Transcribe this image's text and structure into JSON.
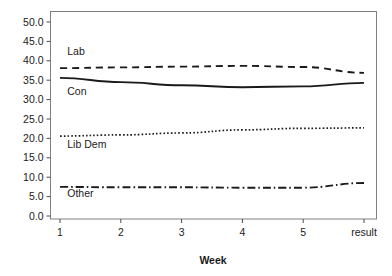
{
  "chart_data": {
    "type": "line",
    "title": "",
    "subtitle": "",
    "xlabel": "Week",
    "ylabel": "",
    "x": [
      1,
      2,
      3,
      4,
      5,
      6
    ],
    "categories": [
      "1",
      "2",
      "3",
      "4",
      "5",
      "result"
    ],
    "xlim": [
      1,
      6
    ],
    "ylim": [
      0,
      52
    ],
    "ytick_values": [
      0,
      5,
      10,
      15,
      20,
      25,
      30,
      35,
      40,
      45,
      50
    ],
    "ytick_labels": [
      "0.0",
      "5.0",
      "10.0",
      "15.0",
      "20.0",
      "25.0",
      "30.0",
      "35.0",
      "40.0",
      "45.0",
      "50.0"
    ],
    "xtick_labels": [
      "1",
      "2",
      "3",
      "4",
      "5",
      "result"
    ],
    "grid": false,
    "legend_position": "inline-annotations",
    "series": [
      {
        "name": "Lab",
        "linestyle": "dashed",
        "color": "#1a1a1a",
        "label_x": 1.12,
        "label_y": 41.5,
        "values": [
          38.1,
          38.3,
          38.5,
          38.7,
          38.4,
          36.9
        ]
      },
      {
        "name": "Con",
        "linestyle": "solid",
        "color": "#1a1a1a",
        "label_x": 1.12,
        "label_y": 31.3,
        "values": [
          35.6,
          34.5,
          33.7,
          33.2,
          33.4,
          34.3
        ]
      },
      {
        "name": "Lib Dem",
        "linestyle": "dotted",
        "color": "#1a1a1a",
        "label_x": 1.12,
        "label_y": 17.5,
        "values": [
          20.6,
          20.9,
          21.4,
          22.2,
          22.6,
          22.7
        ]
      },
      {
        "name": "Other",
        "linestyle": "dashdot",
        "color": "#1a1a1a",
        "label_x": 1.12,
        "label_y": 4.9,
        "values": [
          7.5,
          7.4,
          7.4,
          7.3,
          7.3,
          8.5
        ]
      }
    ]
  },
  "axis": {
    "x_title": "Week"
  },
  "colors": {
    "line": "#1a1a1a",
    "frame": "#808080",
    "background": "#ffffff",
    "text": "#1a1a1a"
  }
}
